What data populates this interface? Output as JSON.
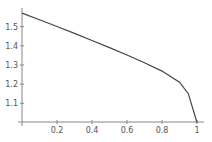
{
  "chart_data": {
    "type": "line",
    "title": "",
    "xlabel": "",
    "ylabel": "",
    "xlim": [
      0,
      1
    ],
    "ylim": [
      1.0,
      1.5708
    ],
    "grid": false,
    "legend": null,
    "x_ticks": [
      "0.2",
      "0.4",
      "0.6",
      "0.8",
      "1"
    ],
    "y_ticks": [
      "1.1",
      "1.2",
      "1.3",
      "1.4",
      "1.5"
    ],
    "series": [
      {
        "name": "f(x)",
        "color": "#444444",
        "x": [
          0,
          0.1,
          0.2,
          0.3,
          0.4,
          0.5,
          0.6,
          0.7,
          0.8,
          0.9,
          0.95,
          1.0
        ],
        "values": [
          1.571,
          1.536,
          1.501,
          1.465,
          1.428,
          1.391,
          1.352,
          1.312,
          1.268,
          1.21,
          1.15,
          1.0
        ]
      }
    ]
  }
}
